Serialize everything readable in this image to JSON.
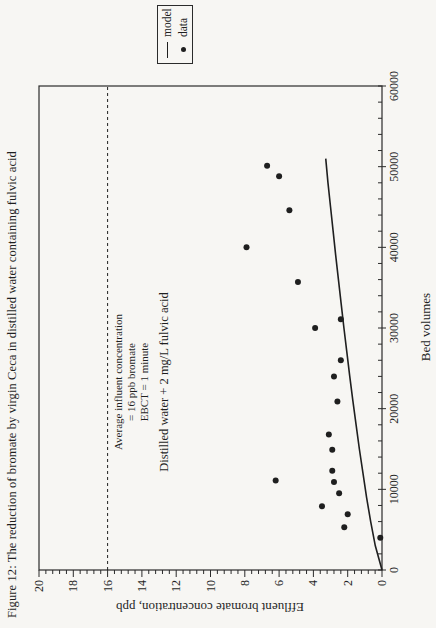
{
  "figure": {
    "title": "Figure 12:  The reduction of bromate by virgin Ceca in distilled water containing fulvic acid"
  },
  "legend": {
    "items": [
      {
        "symbol": "line",
        "label": "model"
      },
      {
        "symbol": "dot",
        "label": "data"
      }
    ]
  },
  "annotation": {
    "lines": [
      "Average influent concentration",
      "= 16 ppb bromate",
      "EBCT = 1 minute"
    ],
    "condition": "Distilled water + 2 mg/L fulvic acid"
  },
  "colors": {
    "ink": "#1f1f1f",
    "frame": "#2b2b2b",
    "background": "#f7f6f3"
  },
  "chart_data": {
    "type": "scatter",
    "title": "Figure 12:  The reduction of bromate by virgin Ceca in distilled water containing fulvic acid",
    "xlabel": "Bed volumes",
    "ylabel": "Effluent bromate concentration, ppb",
    "xlim": [
      0,
      60000
    ],
    "ylim": [
      0,
      20
    ],
    "x_ticks": [
      0,
      10000,
      20000,
      30000,
      40000,
      50000,
      60000
    ],
    "y_ticks": [
      0,
      2,
      4,
      6,
      8,
      10,
      12,
      14,
      16,
      18,
      20
    ],
    "x_minor_step": 2000,
    "y_minor_step": 0.4,
    "grid": false,
    "legend_position": "right-outside",
    "reference_line": {
      "y": 16,
      "style": "dashed",
      "label": "influent concentration = 16 ppb"
    },
    "series": [
      {
        "name": "data",
        "type": "scatter",
        "marker": "filled-circle",
        "color": "#1f1f1f",
        "points": [
          [
            4000,
            0.1
          ],
          [
            5300,
            2.2
          ],
          [
            6900,
            2.0
          ],
          [
            7900,
            3.5
          ],
          [
            9500,
            2.5
          ],
          [
            10900,
            2.8
          ],
          [
            11100,
            6.2
          ],
          [
            12300,
            2.9
          ],
          [
            14900,
            2.9
          ],
          [
            16800,
            3.1
          ],
          [
            20900,
            2.6
          ],
          [
            24000,
            2.8
          ],
          [
            26000,
            2.4
          ],
          [
            30000,
            3.9
          ],
          [
            31100,
            2.4
          ],
          [
            35700,
            4.9
          ],
          [
            40000,
            7.9
          ],
          [
            44600,
            5.4
          ],
          [
            48800,
            6.0
          ],
          [
            50100,
            6.7
          ]
        ]
      },
      {
        "name": "model",
        "type": "line",
        "color": "#1f1f1f",
        "points": [
          [
            0,
            0
          ],
          [
            3000,
            0.39
          ],
          [
            6000,
            0.66
          ],
          [
            9000,
            0.9
          ],
          [
            12000,
            1.11
          ],
          [
            15000,
            1.32
          ],
          [
            18000,
            1.51
          ],
          [
            21000,
            1.7
          ],
          [
            24000,
            1.88
          ],
          [
            27000,
            2.05
          ],
          [
            30000,
            2.22
          ],
          [
            33000,
            2.38
          ],
          [
            36000,
            2.54
          ],
          [
            39000,
            2.7
          ],
          [
            42000,
            2.85
          ],
          [
            45000,
            3.0
          ],
          [
            48000,
            3.15
          ],
          [
            51000,
            3.28
          ]
        ]
      }
    ]
  }
}
